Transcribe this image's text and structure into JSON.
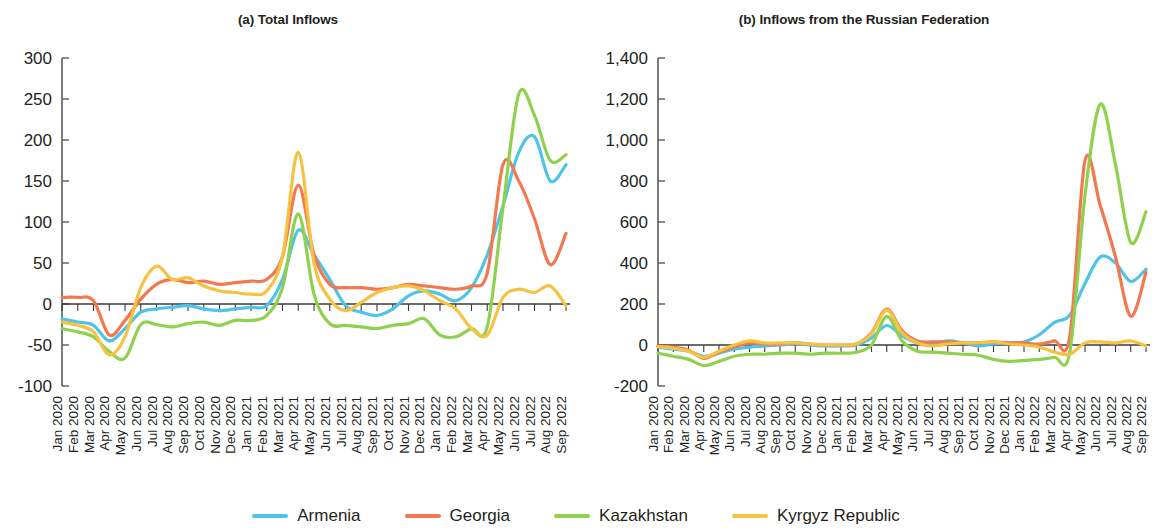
{
  "figure": {
    "background": "#ffffff"
  },
  "legend": {
    "position": "bottom-center",
    "items": [
      {
        "label": "Armenia",
        "color": "#4FC3E8"
      },
      {
        "label": "Georgia",
        "color": "#F4784F"
      },
      {
        "label": "Kazakhstan",
        "color": "#8FD14F"
      },
      {
        "label": "Kyrgyz Republic",
        "color": "#F5C242"
      }
    ]
  },
  "chart_data": [
    {
      "type": "line",
      "panel": "a",
      "title": "(a) Total Inflows",
      "xlabel": "",
      "ylabel": "",
      "grid": false,
      "ylim": [
        -100,
        300
      ],
      "yticks": [
        -100,
        -50,
        0,
        50,
        100,
        150,
        200,
        250,
        300
      ],
      "ytick_labels": [
        "-100",
        "-50",
        "0",
        "50",
        "100",
        "150",
        "200",
        "250",
        "300"
      ],
      "x": [
        "Jan 2020",
        "Feb 2020",
        "Mar 2020",
        "Apr 2020",
        "May 2020",
        "Jun 2020",
        "Jul 2020",
        "Aug 2020",
        "Sep 2020",
        "Oct 2020",
        "Nov 2020",
        "Dec 2020",
        "Jan 2021",
        "Feb 2021",
        "Mar 2021",
        "Apr 2021",
        "May 2021",
        "Jun 2021",
        "Jul 2021",
        "Aug 2021",
        "Sep 2021",
        "Oct 2021",
        "Nov 2021",
        "Dec 2021",
        "Jan 2022",
        "Feb 2022",
        "Mar 2022",
        "Apr 2022",
        "May 2022",
        "Jun 2022",
        "Jul 2022",
        "Aug 2022",
        "Sep 2022"
      ],
      "series": [
        {
          "name": "Armenia",
          "color": "#4FC3E8",
          "values": [
            -18,
            -22,
            -26,
            -45,
            -30,
            -10,
            -6,
            -4,
            -2,
            -6,
            -8,
            -6,
            -4,
            -2,
            30,
            90,
            60,
            30,
            -2,
            -10,
            -14,
            -6,
            10,
            16,
            12,
            4,
            20,
            60,
            120,
            185,
            204,
            150,
            170
          ]
        },
        {
          "name": "Georgia",
          "color": "#F4784F",
          "values": [
            8,
            8,
            4,
            -38,
            -20,
            6,
            24,
            30,
            26,
            28,
            24,
            26,
            28,
            30,
            58,
            145,
            60,
            24,
            20,
            20,
            18,
            20,
            24,
            22,
            20,
            18,
            22,
            38,
            170,
            150,
            104,
            48,
            86
          ]
        },
        {
          "name": "Kazakhstan",
          "color": "#8FD14F",
          "values": [
            -30,
            -34,
            -40,
            -58,
            -66,
            -25,
            -25,
            -28,
            -24,
            -22,
            -26,
            -20,
            -20,
            -14,
            20,
            110,
            12,
            -24,
            -26,
            -28,
            -30,
            -26,
            -24,
            -18,
            -38,
            -40,
            -30,
            -28,
            118,
            256,
            230,
            175,
            182
          ]
        },
        {
          "name": "Kyrgyz Republic",
          "color": "#F5C242",
          "values": [
            -22,
            -26,
            -34,
            -62,
            -40,
            20,
            46,
            30,
            32,
            22,
            16,
            14,
            12,
            16,
            58,
            185,
            50,
            6,
            -8,
            2,
            14,
            20,
            22,
            16,
            4,
            -6,
            -30,
            -38,
            8,
            18,
            14,
            22,
            -2
          ]
        }
      ]
    },
    {
      "type": "line",
      "panel": "b",
      "title": "(b) Inflows from the Russian Federation",
      "xlabel": "",
      "ylabel": "",
      "grid": false,
      "ylim": [
        -200,
        1400
      ],
      "yticks": [
        -200,
        0,
        200,
        400,
        600,
        800,
        1000,
        1200,
        1400
      ],
      "ytick_labels": [
        "-200",
        "0",
        "200",
        "400",
        "600",
        "800",
        "1,000",
        "1,200",
        "1,400"
      ],
      "x": [
        "Jan 2020",
        "Feb 2020",
        "Mar 2020",
        "Apr 2020",
        "May 2020",
        "Jun 2020",
        "Jul 2020",
        "Aug 2020",
        "Sep 2020",
        "Oct 2020",
        "Nov 2020",
        "Dec 2020",
        "Jan 2021",
        "Feb 2021",
        "Mar 2021",
        "Apr 2021",
        "May 2021",
        "Jun 2021",
        "Jul 2021",
        "Aug 2021",
        "Sep 2021",
        "Oct 2021",
        "Nov 2021",
        "Dec 2021",
        "Jan 2022",
        "Feb 2022",
        "Mar 2022",
        "Apr 2022",
        "May 2022",
        "Jun 2022",
        "Jul 2022",
        "Aug 2022",
        "Sep 2022"
      ],
      "series": [
        {
          "name": "Armenia",
          "color": "#4FC3E8",
          "values": [
            -10,
            -20,
            -30,
            -55,
            -40,
            -20,
            -10,
            -5,
            0,
            5,
            0,
            -5,
            -5,
            0,
            35,
            95,
            45,
            10,
            5,
            20,
            10,
            -5,
            5,
            10,
            15,
            50,
            110,
            145,
            300,
            430,
            400,
            310,
            370
          ]
        },
        {
          "name": "Georgia",
          "color": "#F4784F",
          "values": [
            -5,
            -10,
            -25,
            -65,
            -35,
            -10,
            10,
            5,
            5,
            10,
            5,
            0,
            0,
            5,
            60,
            175,
            70,
            20,
            15,
            15,
            10,
            10,
            15,
            10,
            10,
            5,
            20,
            40,
            900,
            680,
            430,
            140,
            355
          ]
        },
        {
          "name": "Kazakhstan",
          "color": "#8FD14F",
          "values": [
            -40,
            -55,
            -70,
            -100,
            -80,
            -55,
            -45,
            -45,
            -40,
            -40,
            -45,
            -40,
            -40,
            -35,
            0,
            140,
            20,
            -30,
            -35,
            -40,
            -45,
            -50,
            -70,
            -80,
            -75,
            -70,
            -60,
            -35,
            730,
            1175,
            880,
            500,
            650
          ]
        },
        {
          "name": "Kyrgyz Republic",
          "color": "#F5C242",
          "values": [
            -8,
            -15,
            -30,
            -60,
            -30,
            0,
            20,
            10,
            10,
            10,
            5,
            0,
            0,
            5,
            55,
            170,
            60,
            10,
            -5,
            5,
            10,
            10,
            15,
            5,
            0,
            -10,
            -35,
            -45,
            10,
            15,
            10,
            20,
            -5
          ]
        }
      ]
    }
  ]
}
